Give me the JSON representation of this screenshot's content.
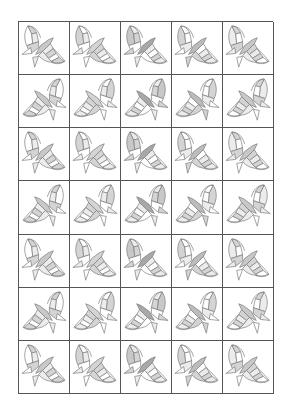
{
  "worksheet": {
    "rows": 7,
    "cols": 5,
    "colors": {
      "outline": "#7a7a7a",
      "grid_line": "#555555",
      "light": "#ececec",
      "medium": "#d4d4d4",
      "dark": "#b4b4b4",
      "white": "#ffffff"
    },
    "cells": [
      [
        {
          "orientation": "A",
          "shade": 0
        },
        {
          "orientation": "A",
          "shade": 1
        },
        {
          "orientation": "A",
          "shade": 2
        },
        {
          "orientation": "A",
          "shade": 3
        },
        {
          "orientation": "A",
          "shade": 4
        }
      ],
      [
        {
          "orientation": "B",
          "shade": 0
        },
        {
          "orientation": "B",
          "shade": 1
        },
        {
          "orientation": "B",
          "shade": 2
        },
        {
          "orientation": "B",
          "shade": 3
        },
        {
          "orientation": "B",
          "shade": 4
        }
      ],
      [
        {
          "orientation": "A",
          "shade": 0
        },
        {
          "orientation": "A",
          "shade": 1
        },
        {
          "orientation": "A",
          "shade": 2
        },
        {
          "orientation": "A",
          "shade": 3
        },
        {
          "orientation": "A",
          "shade": 4
        }
      ],
      [
        {
          "orientation": "B",
          "shade": 0
        },
        {
          "orientation": "B",
          "shade": 1
        },
        {
          "orientation": "B",
          "shade": 2
        },
        {
          "orientation": "B",
          "shade": 3
        },
        {
          "orientation": "B",
          "shade": 4
        }
      ],
      [
        {
          "orientation": "A",
          "shade": 0
        },
        {
          "orientation": "A",
          "shade": 1
        },
        {
          "orientation": "A",
          "shade": 2
        },
        {
          "orientation": "A",
          "shade": 3
        },
        {
          "orientation": "A",
          "shade": 4
        }
      ],
      [
        {
          "orientation": "B",
          "shade": 0
        },
        {
          "orientation": "B",
          "shade": 1
        },
        {
          "orientation": "B",
          "shade": 2
        },
        {
          "orientation": "B",
          "shade": 3
        },
        {
          "orientation": "B",
          "shade": 4
        }
      ],
      [
        {
          "orientation": "A",
          "shade": 0
        },
        {
          "orientation": "A",
          "shade": 1
        },
        {
          "orientation": "A",
          "shade": 2
        },
        {
          "orientation": "A",
          "shade": 3
        },
        {
          "orientation": "A",
          "shade": 4
        }
      ]
    ],
    "shade_patterns": [
      {
        "upper_wing": [
          "#ffffff",
          "#d4d4d4",
          "#ececec",
          "#d4d4d4"
        ],
        "body": "#c8c8c8",
        "lower_wing": [
          "#ececec",
          "#d4d4d4",
          "#ffffff",
          "#d4d4d4",
          "#ececec"
        ],
        "tri_left": "#ffffff",
        "tri_bottom": "#ececec"
      },
      {
        "upper_wing": [
          "#d4d4d4",
          "#ffffff",
          "#ececec",
          "#ffffff"
        ],
        "body": "#d4d4d4",
        "lower_wing": [
          "#d4d4d4",
          "#ececec",
          "#ffffff",
          "#ececec",
          "#d4d4d4"
        ],
        "tri_left": "#ececec",
        "tri_bottom": "#ffffff"
      },
      {
        "upper_wing": [
          "#c8c8c8",
          "#ececec",
          "#d4d4d4",
          "#ffffff"
        ],
        "body": "#a8a8a8",
        "lower_wing": [
          "#ececec",
          "#ffffff",
          "#d4d4d4",
          "#ececec",
          "#ffffff"
        ],
        "tri_left": "#d4d4d4",
        "tri_bottom": "#ececec"
      },
      {
        "upper_wing": [
          "#d4d4d4",
          "#ffffff",
          "#ffffff",
          "#ececec"
        ],
        "body": "#bcbcbc",
        "lower_wing": [
          "#ffffff",
          "#ececec",
          "#d4d4d4",
          "#ececec",
          "#d4d4d4"
        ],
        "tri_left": "#ffffff",
        "tri_bottom": "#d4d4d4"
      },
      {
        "upper_wing": [
          "#ececec",
          "#d4d4d4",
          "#ffffff",
          "#d4d4d4"
        ],
        "body": "#c8c8c8",
        "lower_wing": [
          "#d4d4d4",
          "#ececec",
          "#d4d4d4",
          "#ffffff",
          "#ececec"
        ],
        "tri_left": "#ececec",
        "tri_bottom": "#ffffff"
      }
    ]
  }
}
